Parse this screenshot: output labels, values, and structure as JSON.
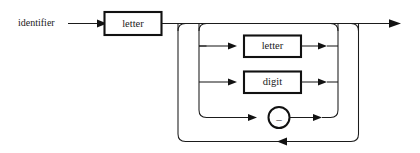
{
  "diagram": {
    "kind": "railroad-syntax-diagram",
    "rule_name": "identifier",
    "entry_label": "identifier",
    "ink_color": "#1a1a1a",
    "background_color": "#ffffff",
    "first_element": {
      "label": "letter",
      "shape": "rectangle"
    },
    "repeat_group": {
      "alternatives": [
        {
          "label": "letter",
          "shape": "rectangle"
        },
        {
          "label": "digit",
          "shape": "rectangle"
        },
        {
          "label": "_",
          "shape": "circle"
        }
      ],
      "loop_back": true,
      "optional": true
    },
    "exit_arrow": "right-arrow"
  }
}
